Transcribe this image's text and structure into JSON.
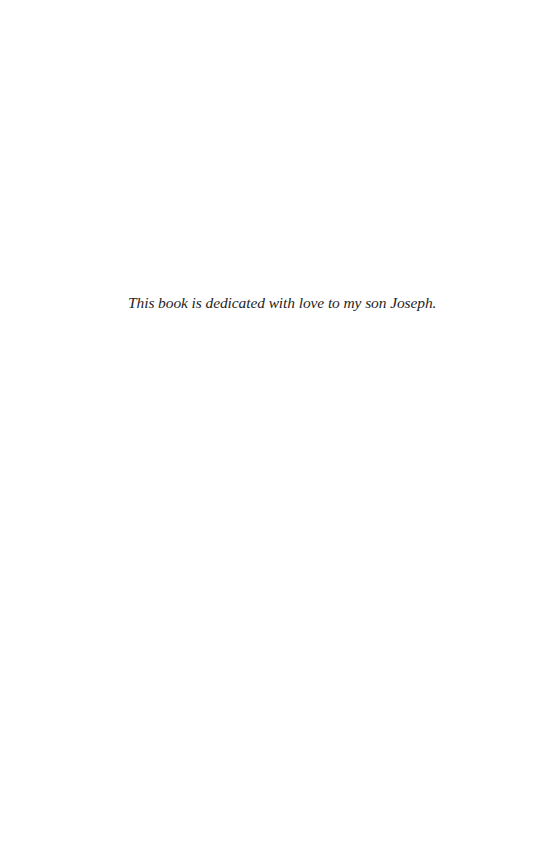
{
  "page": {
    "dedication": "This book is dedicated with love to my son Joseph.",
    "background_color": "#ffffff",
    "text_color": "#1f1f1f"
  }
}
